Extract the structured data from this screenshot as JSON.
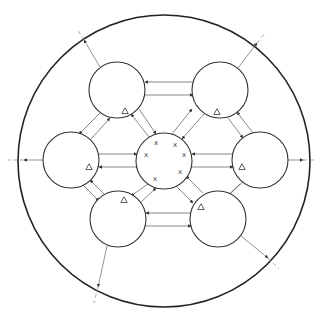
{
  "diagram": {
    "title": "",
    "colors": {
      "stroke": "#333333",
      "background": "#ffffff"
    },
    "outer_circle": {
      "cx": 164,
      "cy": 161,
      "r": 146
    },
    "center_node": {
      "id": "center",
      "cx": 164,
      "cy": 161,
      "r": 28,
      "marker": "x",
      "marks": [
        {
          "x": 156,
          "y": 143,
          "label": "x"
        },
        {
          "x": 175,
          "y": 145,
          "label": "x"
        },
        {
          "x": 146,
          "y": 155,
          "label": "x"
        },
        {
          "x": 184,
          "y": 155,
          "label": "x"
        },
        {
          "x": 155,
          "y": 179,
          "label": "x"
        },
        {
          "x": 180,
          "y": 172,
          "label": "x"
        }
      ]
    },
    "outer_nodes": [
      {
        "id": "top-left",
        "cx": 117,
        "cy": 90,
        "r": 28,
        "marker": "triangle",
        "mx": 125,
        "my": 111
      },
      {
        "id": "top-right",
        "cx": 220,
        "cy": 90,
        "r": 28,
        "marker": "triangle",
        "mx": 217,
        "my": 112
      },
      {
        "id": "left",
        "cx": 71,
        "cy": 160,
        "r": 28,
        "marker": "triangle",
        "mx": 89,
        "my": 167
      },
      {
        "id": "right",
        "cx": 260,
        "cy": 160,
        "r": 28,
        "marker": "triangle",
        "mx": 242,
        "my": 167
      },
      {
        "id": "bottom-left",
        "cx": 118,
        "cy": 219,
        "r": 28,
        "marker": "triangle",
        "mx": 124,
        "my": 200
      },
      {
        "id": "bottom-right",
        "cx": 218,
        "cy": 219,
        "r": 28,
        "marker": "triangle",
        "mx": 201,
        "my": 207
      }
    ],
    "links": [
      {
        "from": "top-right",
        "to": "top-left",
        "x1": 193,
        "y1": 82,
        "x2": 145,
        "y2": 82
      },
      {
        "from": "top-left",
        "to": "top-right",
        "x1": 145,
        "y1": 95,
        "x2": 193,
        "y2": 95
      },
      {
        "from": "left",
        "to": "center",
        "x1": 99,
        "y1": 154,
        "x2": 137,
        "y2": 154
      },
      {
        "from": "center",
        "to": "left",
        "x1": 137,
        "y1": 167,
        "x2": 99,
        "y2": 167
      },
      {
        "from": "right",
        "to": "center",
        "x1": 233,
        "y1": 154,
        "x2": 192,
        "y2": 154
      },
      {
        "from": "center",
        "to": "right",
        "x1": 192,
        "y1": 167,
        "x2": 233,
        "y2": 167
      },
      {
        "from": "bottom-right",
        "to": "bottom-left",
        "x1": 191,
        "y1": 213,
        "x2": 146,
        "y2": 213
      },
      {
        "from": "bottom-left",
        "to": "bottom-right",
        "x1": 146,
        "y1": 226,
        "x2": 191,
        "y2": 226
      },
      {
        "from": "center",
        "to": "top-left",
        "x1": 149,
        "y1": 137,
        "x2": 131,
        "y2": 114
      },
      {
        "from": "top-left",
        "to": "center",
        "x1": 139,
        "y1": 109,
        "x2": 156,
        "y2": 134
      },
      {
        "from": "center",
        "to": "top-right",
        "x1": 172,
        "y1": 134,
        "x2": 192,
        "y2": 109
      },
      {
        "from": "top-right",
        "to": "center",
        "x1": 204,
        "y1": 114,
        "x2": 182,
        "y2": 139
      },
      {
        "from": "top-left",
        "to": "left",
        "x1": 100,
        "y1": 113,
        "x2": 79,
        "y2": 134
      },
      {
        "from": "left",
        "to": "top-left",
        "x1": 91,
        "y1": 139,
        "x2": 110,
        "y2": 118
      },
      {
        "from": "right",
        "to": "top-right",
        "x1": 253,
        "y1": 133,
        "x2": 237,
        "y2": 112
      },
      {
        "from": "top-right",
        "to": "right",
        "x1": 228,
        "y1": 118,
        "x2": 243,
        "y2": 138
      },
      {
        "from": "left",
        "to": "bottom-left",
        "x1": 83,
        "y1": 185,
        "x2": 99,
        "y2": 201
      },
      {
        "from": "bottom-left",
        "to": "left",
        "x1": 104,
        "y1": 194,
        "x2": 90,
        "y2": 180
      },
      {
        "from": "bottom-right",
        "to": "right",
        "x1": 230,
        "y1": 194,
        "x2": 247,
        "y2": 178
      },
      {
        "from": "right",
        "to": "bottom-right",
        "x1": 240,
        "y1": 184,
        "x2": 223,
        "y2": 200
      },
      {
        "from": "center",
        "to": "bottom-left",
        "x1": 148,
        "y1": 184,
        "x2": 131,
        "y2": 196
      },
      {
        "from": "bottom-left",
        "to": "center",
        "x1": 141,
        "y1": 202,
        "x2": 156,
        "y2": 188
      },
      {
        "from": "center",
        "to": "bottom-right",
        "x1": 176,
        "y1": 186,
        "x2": 193,
        "y2": 203
      },
      {
        "from": "bottom-right",
        "to": "center",
        "x1": 203,
        "y1": 193,
        "x2": 186,
        "y2": 176
      }
    ],
    "exits": [
      {
        "from": "top-left",
        "x1": 100,
        "y1": 67,
        "x2": 84,
        "y2": 40,
        "dx": 77,
        "dy": 29
      },
      {
        "from": "top-right",
        "x1": 238,
        "y1": 68,
        "x2": 257,
        "y2": 43,
        "dx": 266,
        "dy": 32
      },
      {
        "from": "left",
        "x1": 43,
        "y1": 160,
        "x2": 24,
        "y2": 160,
        "dx": 8,
        "dy": 160
      },
      {
        "from": "right",
        "x1": 288,
        "y1": 160,
        "x2": 303,
        "y2": 160,
        "dx": 316,
        "dy": 160
      },
      {
        "from": "bottom-left",
        "x1": 107,
        "y1": 246,
        "x2": 98,
        "y2": 287,
        "dx": 94,
        "dy": 303
      },
      {
        "from": "bottom-right",
        "x1": 241,
        "y1": 236,
        "x2": 268,
        "y2": 258,
        "dx": 279,
        "dy": 269
      }
    ]
  }
}
